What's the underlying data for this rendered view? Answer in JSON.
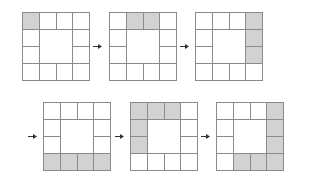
{
  "diagram": {
    "grid_size": 4,
    "colors": {
      "border": "#8a8a8a",
      "shaded": "#d2d2d2",
      "empty": "#ffffff",
      "arrow": "#333333"
    },
    "steps": [
      {
        "index": 1,
        "position": {
          "x": 22,
          "y": 12
        },
        "shaded_cells": [
          [
            0,
            0
          ]
        ]
      },
      {
        "index": 2,
        "position": {
          "x": 109,
          "y": 12
        },
        "shaded_cells": [
          [
            0,
            1
          ],
          [
            0,
            2
          ]
        ]
      },
      {
        "index": 3,
        "position": {
          "x": 195,
          "y": 12
        },
        "shaded_cells": [
          [
            0,
            3
          ],
          [
            1,
            3
          ],
          [
            2,
            3
          ]
        ]
      },
      {
        "index": 4,
        "position": {
          "x": 43,
          "y": 102
        },
        "shaded_cells": [
          [
            3,
            0
          ],
          [
            3,
            1
          ],
          [
            3,
            2
          ],
          [
            3,
            3
          ]
        ]
      },
      {
        "index": 5,
        "position": {
          "x": 130,
          "y": 102
        },
        "shaded_cells": [
          [
            0,
            0
          ],
          [
            0,
            1
          ],
          [
            0,
            2
          ],
          [
            1,
            0
          ],
          [
            2,
            0
          ]
        ]
      },
      {
        "index": 6,
        "position": {
          "x": 216,
          "y": 102
        },
        "shaded_cells": [
          [
            0,
            3
          ],
          [
            1,
            3
          ],
          [
            2,
            3
          ],
          [
            3,
            3
          ],
          [
            3,
            1
          ],
          [
            3,
            2
          ]
        ]
      }
    ],
    "arrows": [
      {
        "from": 1,
        "to": 2,
        "x": 93,
        "y": 44
      },
      {
        "from": 2,
        "to": 3,
        "x": 180,
        "y": 44
      },
      {
        "from": 3,
        "to": 4,
        "x": 28,
        "y": 134
      },
      {
        "from": 4,
        "to": 5,
        "x": 115,
        "y": 134
      },
      {
        "from": 5,
        "to": 6,
        "x": 201,
        "y": 134
      }
    ]
  }
}
